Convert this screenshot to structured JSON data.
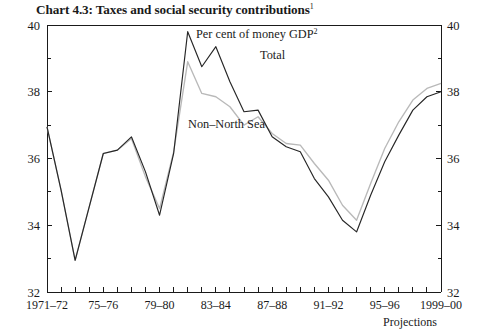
{
  "title": {
    "text": "Chart 4.3: Taxes and social security contributions",
    "footnote_marker": "1"
  },
  "annotations": {
    "units": "Per cent of money GDP",
    "units_marker": "2",
    "total_label": "Total",
    "nonnorthsea_label": "Non–North Sea",
    "projections_label": "Projections"
  },
  "colors": {
    "total": "#262626",
    "non_north_sea": "#b9b9b9",
    "axis": "#1a1a1a",
    "background": "#ffffff"
  },
  "chart_data": {
    "type": "line",
    "title": "Chart 4.3: Taxes and social security contributions",
    "xlabel": "",
    "ylabel": "Per cent of money GDP",
    "ylim": [
      32,
      40
    ],
    "ytick_labels_left": [
      "40",
      "38",
      "36",
      "34",
      "32"
    ],
    "ytick_labels_right": [
      "40",
      "38",
      "36",
      "34",
      "32"
    ],
    "ytick_values": [
      40,
      38,
      36,
      34,
      32
    ],
    "yminor_values": [
      39,
      37,
      35,
      33
    ],
    "grid": false,
    "legend": "inline-labels",
    "x_tick_labels": [
      "1971–72",
      "75–76",
      "79–80",
      "83–84",
      "87–88",
      "91–92",
      "95–96",
      "1999–00"
    ],
    "x_tick_label_positions": [
      0,
      4,
      8,
      12,
      16,
      20,
      24,
      28
    ],
    "x": [
      "1971-72",
      "1972-73",
      "1973-74",
      "1974-75",
      "1975-76",
      "1976-77",
      "1977-78",
      "1978-79",
      "1979-80",
      "1980-81",
      "1981-82",
      "1982-83",
      "1983-84",
      "1984-85",
      "1985-86",
      "1986-87",
      "1987-88",
      "1988-89",
      "1989-90",
      "1990-91",
      "1991-92",
      "1992-93",
      "1993-94",
      "1994-95",
      "1995-96",
      "1996-97",
      "1997-98",
      "1998-99",
      "1999-00"
    ],
    "series": [
      {
        "name": "Total",
        "color": "#262626",
        "values": [
          36.95,
          35.05,
          32.95,
          34.55,
          36.15,
          36.25,
          36.65,
          35.6,
          34.3,
          36.15,
          39.8,
          38.75,
          39.35,
          38.3,
          37.4,
          37.45,
          36.65,
          36.35,
          36.2,
          35.4,
          34.85,
          34.15,
          33.8,
          34.9,
          35.9,
          36.7,
          37.45,
          37.85,
          38.0
        ]
      },
      {
        "name": "Non–North Sea",
        "color": "#b9b9b9",
        "values": [
          36.95,
          35.05,
          32.95,
          34.55,
          36.15,
          36.25,
          36.6,
          35.45,
          34.5,
          36.2,
          38.9,
          37.95,
          37.85,
          37.55,
          37.0,
          37.25,
          36.75,
          36.45,
          36.4,
          35.85,
          35.35,
          34.6,
          34.15,
          35.25,
          36.3,
          37.1,
          37.75,
          38.1,
          38.25
        ]
      }
    ]
  }
}
